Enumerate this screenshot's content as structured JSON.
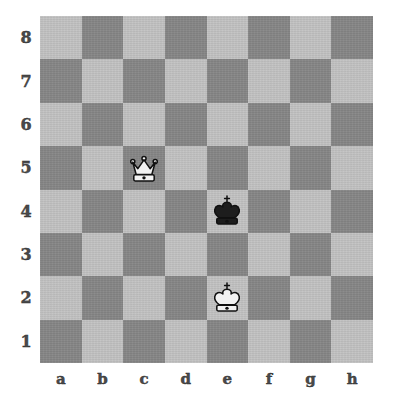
{
  "board": {
    "title": "Chess diagram",
    "light_square_color": "#c2c2c2",
    "dark_square_color": "#868686",
    "background_color": "#ffffff",
    "files": [
      "a",
      "b",
      "c",
      "d",
      "e",
      "f",
      "g",
      "h"
    ],
    "ranks": [
      "8",
      "7",
      "6",
      "5",
      "4",
      "3",
      "2",
      "1"
    ],
    "orientation": "white-bottom",
    "squares": [
      [
        "light",
        "dark",
        "light",
        "dark",
        "light",
        "dark",
        "light",
        "dark"
      ],
      [
        "dark",
        "light",
        "dark",
        "light",
        "dark",
        "light",
        "dark",
        "light"
      ],
      [
        "light",
        "dark",
        "light",
        "dark",
        "light",
        "dark",
        "light",
        "dark"
      ],
      [
        "dark",
        "light",
        "dark",
        "light",
        "dark",
        "light",
        "dark",
        "light"
      ],
      [
        "light",
        "dark",
        "light",
        "dark",
        "light",
        "dark",
        "light",
        "dark"
      ],
      [
        "dark",
        "light",
        "dark",
        "light",
        "dark",
        "light",
        "dark",
        "light"
      ],
      [
        "light",
        "dark",
        "light",
        "dark",
        "light",
        "dark",
        "light",
        "dark"
      ],
      [
        "dark",
        "light",
        "dark",
        "light",
        "dark",
        "light",
        "dark",
        "light"
      ]
    ],
    "pieces": [
      {
        "square": "c5",
        "file": "c",
        "rank": "5",
        "color": "white",
        "type": "queen",
        "glyph": "white-queen-icon"
      },
      {
        "square": "e4",
        "file": "e",
        "rank": "4",
        "color": "black",
        "type": "king",
        "glyph": "black-king-icon"
      },
      {
        "square": "e2",
        "file": "e",
        "rank": "2",
        "color": "white",
        "type": "king",
        "glyph": "white-king-icon"
      }
    ]
  }
}
